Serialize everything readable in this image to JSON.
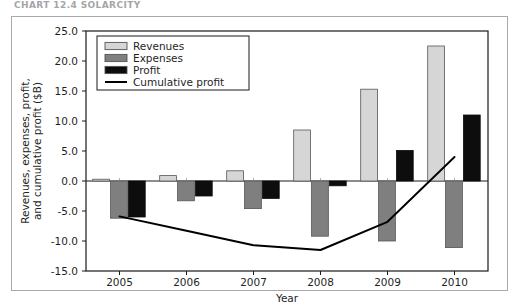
{
  "figure": {
    "caption_fragment": "CHART 12.4  SOLARCITY",
    "frame_border_color": "#a9a9ad"
  },
  "chart_data": {
    "type": "bar",
    "title": "",
    "subtitle": "",
    "xlabel": "Year",
    "ylabel": "Revenues, expenses, profit, and cumulative profit ($B)",
    "categories": [
      "2005",
      "2006",
      "2007",
      "2008",
      "2009",
      "2010"
    ],
    "x": [
      2005,
      2006,
      2007,
      2008,
      2009,
      2010
    ],
    "ylim": [
      -15.0,
      25.0
    ],
    "yticks": [
      -15.0,
      -10.0,
      -5.0,
      0.0,
      5.0,
      10.0,
      15.0,
      20.0,
      25.0
    ],
    "ytick_labels": [
      "-15.0",
      "-10.0",
      "-5.0",
      "0.0",
      "5.0",
      "10.0",
      "15.0",
      "20.0",
      "25.0"
    ],
    "grid": false,
    "legend_position": "upper left",
    "zero_line": true,
    "series": [
      {
        "name": "Revenues",
        "kind": "bar",
        "color": "#d6d6d6",
        "edge_color": "#555555",
        "values": [
          0.3,
          0.9,
          1.7,
          8.5,
          15.3,
          22.5
        ]
      },
      {
        "name": "Expenses",
        "kind": "bar",
        "color": "#7f7f7f",
        "edge_color": "#555555",
        "values": [
          -6.2,
          -3.3,
          -4.6,
          -9.2,
          -10.0,
          -11.1
        ]
      },
      {
        "name": "Profit",
        "kind": "bar",
        "color": "#0d0d0d",
        "edge_color": "#0d0d0d",
        "values": [
          -6.0,
          -2.5,
          -2.9,
          -0.8,
          5.1,
          11.0
        ]
      },
      {
        "name": "Cumulative profit",
        "kind": "line",
        "color": "#000000",
        "values": [
          -5.9,
          -8.3,
          -10.7,
          -11.5,
          -6.8,
          4.0
        ]
      }
    ]
  },
  "legend": {
    "entries": [
      {
        "label": "Revenues",
        "swatch": "#d6d6d6",
        "type": "patch"
      },
      {
        "label": "Expenses",
        "swatch": "#7f7f7f",
        "type": "patch"
      },
      {
        "label": "Profit",
        "swatch": "#0d0d0d",
        "type": "patch"
      },
      {
        "label": "Cumulative profit",
        "swatch": "#000000",
        "type": "line"
      }
    ]
  }
}
